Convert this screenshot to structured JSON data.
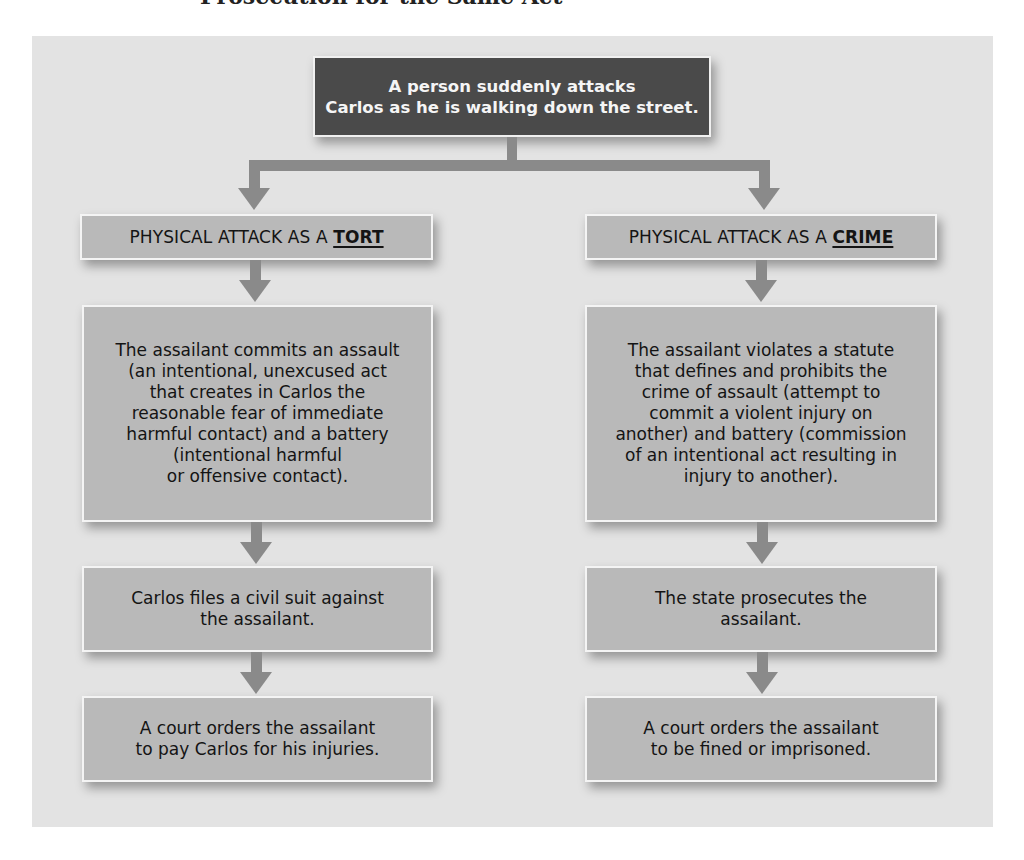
{
  "page": {
    "cropped_heading": "Prosecution for the Same Act"
  },
  "diagram": {
    "root": {
      "text": "A person suddenly attacks\nCarlos as he is walking down the street."
    },
    "branches": [
      {
        "id": "tort",
        "header_prefix": "PHYSICAL ATTACK AS A ",
        "header_emphasis": "TORT",
        "steps": [
          "The assailant commits an assault\n(an intentional, unexcused act\nthat creates in Carlos the\nreasonable fear of immediate\nharmful contact) and a battery\n(intentional harmful\nor offensive contact).",
          "Carlos files a civil suit against\nthe assailant.",
          "A court orders the assailant\nto pay Carlos for his injuries."
        ]
      },
      {
        "id": "crime",
        "header_prefix": "PHYSICAL ATTACK AS A ",
        "header_emphasis": "CRIME",
        "steps": [
          "The assailant violates a statute\nthat defines and prohibits the\ncrime of assault (attempt to\ncommit a violent injury on\nanother) and battery (commission\nof an intentional act resulting in\ninjury to another).",
          "The state prosecutes the\nassailant.",
          "A court orders the assailant\nto be fined or imprisoned."
        ]
      }
    ],
    "colors": {
      "panel_bg": "#e3e3e3",
      "root_box": "#4a4a4a",
      "step_box": "#b9b9b9",
      "arrow": "#8a8a8a",
      "box_border": "#f4f4f4"
    }
  }
}
